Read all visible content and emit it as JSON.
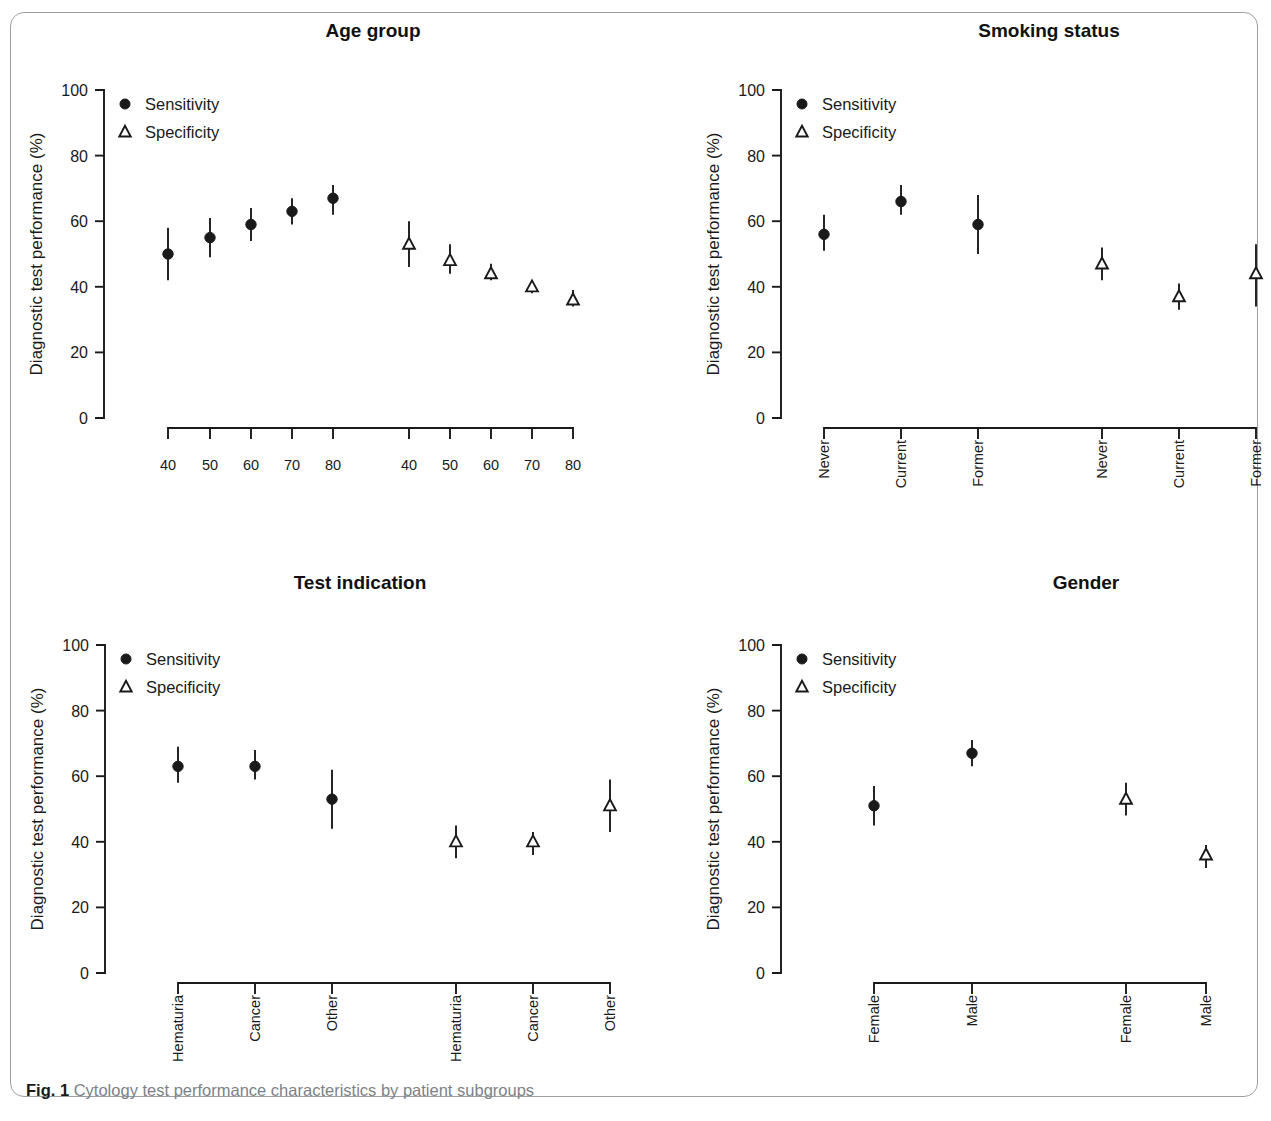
{
  "figure": {
    "caption_tag": "Fig. 1",
    "caption_text": "Cytology test performance characteristics by patient subgroups"
  },
  "legend": {
    "sensitivity_label": "Sensitivity",
    "specificity_label": "Specificity"
  },
  "axis": {
    "y_title": "Diagnostic test performance (%)",
    "y_ticks": [
      "0",
      "20",
      "40",
      "60",
      "80",
      "100"
    ]
  },
  "chart_data": [
    {
      "type": "scatter",
      "panel_id": "age",
      "title": "Age group",
      "xlabel": "",
      "ylabel": "Diagnostic test performance (%)",
      "ylim": [
        0,
        100
      ],
      "yticks": [
        0,
        20,
        40,
        60,
        80,
        100
      ],
      "grid": false,
      "legend": [
        "Sensitivity",
        "Specificity"
      ],
      "legend_position": "top-left",
      "categories": [
        "40",
        "50",
        "60",
        "70",
        "80"
      ],
      "series": [
        {
          "name": "Sensitivity",
          "marker": "filled-circle",
          "values": [
            50,
            55,
            59,
            63,
            67
          ],
          "ci_low": [
            42,
            49,
            54,
            59,
            62
          ],
          "ci_high": [
            58,
            61,
            64,
            67,
            71
          ]
        },
        {
          "name": "Specificity",
          "marker": "open-triangle",
          "values": [
            53,
            48,
            44,
            40,
            36
          ],
          "ci_low": [
            46,
            44,
            42,
            38,
            34
          ],
          "ci_high": [
            60,
            53,
            47,
            42,
            39
          ]
        }
      ]
    },
    {
      "type": "scatter",
      "panel_id": "smoking",
      "title": "Smoking status",
      "xlabel": "",
      "ylabel": "Diagnostic test performance (%)",
      "ylim": [
        0,
        100
      ],
      "yticks": [
        0,
        20,
        40,
        60,
        80,
        100
      ],
      "grid": false,
      "legend": [
        "Sensitivity",
        "Specificity"
      ],
      "legend_position": "top-left",
      "categories": [
        "Never",
        "Current",
        "Former"
      ],
      "series": [
        {
          "name": "Sensitivity",
          "marker": "filled-circle",
          "values": [
            56,
            66,
            59
          ],
          "ci_low": [
            51,
            62,
            50
          ],
          "ci_high": [
            62,
            71,
            68
          ]
        },
        {
          "name": "Specificity",
          "marker": "open-triangle",
          "values": [
            47,
            37,
            44
          ],
          "ci_low": [
            42,
            33,
            34
          ],
          "ci_high": [
            52,
            41,
            53
          ]
        }
      ]
    },
    {
      "type": "scatter",
      "panel_id": "test_indication",
      "title": "Test indication",
      "xlabel": "",
      "ylabel": "Diagnostic test performance (%)",
      "ylim": [
        0,
        100
      ],
      "yticks": [
        0,
        20,
        40,
        60,
        80,
        100
      ],
      "grid": false,
      "legend": [
        "Sensitivity",
        "Specificity"
      ],
      "legend_position": "top-left",
      "categories": [
        "Hematuria",
        "Cancer",
        "Other"
      ],
      "series": [
        {
          "name": "Sensitivity",
          "marker": "filled-circle",
          "values": [
            63,
            63,
            53
          ],
          "ci_low": [
            58,
            59,
            44
          ],
          "ci_high": [
            69,
            68,
            62
          ]
        },
        {
          "name": "Specificity",
          "marker": "open-triangle",
          "values": [
            40,
            40,
            51
          ],
          "ci_low": [
            35,
            36,
            43
          ],
          "ci_high": [
            45,
            43,
            59
          ]
        }
      ]
    },
    {
      "type": "scatter",
      "panel_id": "gender",
      "title": "Gender",
      "xlabel": "",
      "ylabel": "Diagnostic test performance (%)",
      "ylim": [
        0,
        100
      ],
      "yticks": [
        0,
        20,
        40,
        60,
        80,
        100
      ],
      "grid": false,
      "legend": [
        "Sensitivity",
        "Specificity"
      ],
      "legend_position": "top-left",
      "categories": [
        "Female",
        "Male"
      ],
      "series": [
        {
          "name": "Sensitivity",
          "marker": "filled-circle",
          "values": [
            51,
            67
          ],
          "ci_low": [
            45,
            63
          ],
          "ci_high": [
            57,
            71
          ]
        },
        {
          "name": "Specificity",
          "marker": "open-triangle",
          "values": [
            53,
            36
          ],
          "ci_low": [
            48,
            32
          ],
          "ci_high": [
            58,
            39
          ]
        }
      ]
    }
  ]
}
